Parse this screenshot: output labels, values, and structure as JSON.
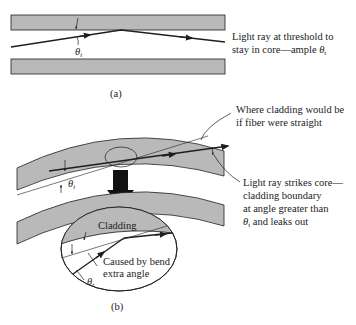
{
  "colors": {
    "cladding": "#b9b9b9",
    "line": "#1e1e1e",
    "background": "#ffffff"
  },
  "panel_a": {
    "caption": "(a)",
    "theta_symbol": "θ",
    "theta_subscript": "t",
    "annotation_line1": "Light ray at threshold to",
    "annotation_line2_prefix": "stay in core—ample ",
    "annotation_line2_symbol": "θ",
    "annotation_line2_subscript": "t"
  },
  "panel_b": {
    "caption": "(b)",
    "theta_symbol": "θ",
    "theta_subscript": "t",
    "callout_straight_line1": "Where cladding would be",
    "callout_straight_line2": "if fiber were straight",
    "callout_leak_line1": "Light ray strikes core—",
    "callout_leak_line2": "cladding boundary",
    "callout_leak_line3": "at angle greater than",
    "callout_leak_line4_symbol": "θ",
    "callout_leak_line4_subscript": "t",
    "callout_leak_line4_suffix": " and leaks out",
    "inset_cladding_label": "Cladding",
    "inset_theta_symbol": "θ",
    "inset_theta_subscript": "t",
    "inset_bend_line1": "Caused by bend",
    "inset_bend_line2": "extra angle"
  }
}
